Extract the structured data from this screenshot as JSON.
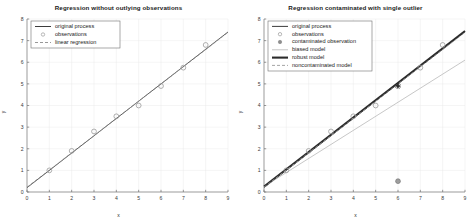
{
  "figure": {
    "width": 474,
    "height": 223,
    "background": "#ffffff"
  },
  "panels": [
    {
      "id": "left-panel",
      "title": "Regression without outlying observations",
      "xlabel": "x",
      "ylabel": "y"
    },
    {
      "id": "right-panel",
      "title": "Regression contaminated with single outlier",
      "xlabel": "x",
      "ylabel": "y"
    }
  ],
  "legend_left": {
    "items": [
      {
        "label": "original process",
        "kind": "line",
        "color": "#3c3c3c",
        "dash": "none",
        "width": 1.0
      },
      {
        "label": "observations",
        "kind": "marker",
        "color": "#9a9a9a",
        "marker": "circle-open"
      },
      {
        "label": "linear regression",
        "kind": "line",
        "color": "#8c8c8c",
        "dash": "dashed",
        "width": 0.9
      }
    ]
  },
  "legend_right": {
    "items": [
      {
        "label": "original process",
        "kind": "line",
        "color": "#3c3c3c",
        "dash": "none",
        "width": 1.0
      },
      {
        "label": "observations",
        "kind": "marker",
        "color": "#9a9a9a",
        "marker": "circle-open"
      },
      {
        "label": "contaminated observation",
        "kind": "marker",
        "color": "#8e8e8e",
        "marker": "circle-filled"
      },
      {
        "label": "biased model",
        "kind": "line",
        "color": "#bdbdbd",
        "dash": "none",
        "width": 0.9
      },
      {
        "label": "robust model",
        "kind": "line",
        "color": "#2b2b2b",
        "dash": "none",
        "width": 2.1
      },
      {
        "label": "noncontaminated model",
        "kind": "line",
        "color": "#9a9a9a",
        "dash": "dashed",
        "width": 0.9
      }
    ]
  },
  "chart_data": [
    {
      "type": "scatter",
      "id": "left",
      "title": "Regression without outlying observations",
      "xlabel": "x",
      "ylabel": "y",
      "xlim": [
        0,
        9
      ],
      "ylim": [
        0,
        8
      ],
      "xticks": [
        0,
        1,
        2,
        3,
        4,
        5,
        6,
        7,
        8,
        9
      ],
      "yticks": [
        0,
        1,
        2,
        3,
        4,
        5,
        6,
        7,
        8
      ],
      "grid": true,
      "legend_position": "upper-left",
      "observations": {
        "x": [
          1,
          2,
          3,
          4,
          5,
          6,
          7,
          8
        ],
        "y": [
          1.0,
          1.9,
          2.8,
          3.5,
          4.0,
          4.9,
          5.75,
          6.8
        ]
      },
      "series": [
        {
          "name": "original process",
          "style": "solid",
          "color": "#3c3c3c",
          "x": [
            0,
            9
          ],
          "y": [
            0.2,
            7.4
          ]
        },
        {
          "name": "linear regression",
          "style": "dashed",
          "color": "#8c8c8c",
          "x": [
            0,
            9
          ],
          "y": [
            0.22,
            7.38
          ]
        }
      ]
    },
    {
      "type": "scatter",
      "id": "right",
      "title": "Regression contaminated with single outlier",
      "xlabel": "x",
      "ylabel": "y",
      "xlim": [
        0,
        9
      ],
      "ylim": [
        0,
        8
      ],
      "xticks": [
        0,
        1,
        2,
        3,
        4,
        5,
        6,
        7,
        8,
        9
      ],
      "yticks": [
        0,
        1,
        2,
        3,
        4,
        5,
        6,
        7,
        8
      ],
      "grid": true,
      "legend_position": "upper-left",
      "observations": {
        "x": [
          1,
          2,
          3,
          4,
          5,
          7,
          8
        ],
        "y": [
          1.0,
          1.9,
          2.8,
          3.5,
          4.0,
          5.75,
          6.8
        ]
      },
      "contaminated_observation": {
        "x": 6,
        "y": 0.5
      },
      "robust_marker": {
        "x": 6,
        "y": 4.9
      },
      "series": [
        {
          "name": "original process",
          "style": "solid",
          "color": "#3c3c3c",
          "x": [
            0,
            9
          ],
          "y": [
            0.2,
            7.4
          ]
        },
        {
          "name": "biased model",
          "style": "solid",
          "color": "#bdbdbd",
          "x": [
            0,
            9
          ],
          "y": [
            0.25,
            6.1
          ]
        },
        {
          "name": "robust model",
          "style": "solid",
          "color": "#2b2b2b",
          "x": [
            0,
            9
          ],
          "y": [
            0.25,
            7.45
          ]
        },
        {
          "name": "noncontaminated model",
          "style": "dashed",
          "color": "#9a9a9a",
          "x": [
            0,
            9
          ],
          "y": [
            0.22,
            7.38
          ]
        }
      ]
    }
  ]
}
